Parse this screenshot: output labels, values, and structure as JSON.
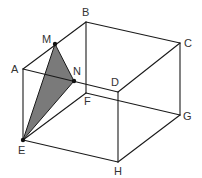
{
  "diagram": {
    "type": "cube-with-shaded-triangle",
    "vertices": {
      "A": {
        "x": 23,
        "y": 69,
        "label": "A",
        "lx": 11,
        "ly": 73
      },
      "B": {
        "x": 86,
        "y": 22,
        "label": "B",
        "lx": 82,
        "ly": 16
      },
      "C": {
        "x": 180,
        "y": 43,
        "label": "C",
        "lx": 184,
        "ly": 47
      },
      "D": {
        "x": 118,
        "y": 92,
        "label": "D",
        "lx": 111,
        "ly": 86
      },
      "E": {
        "x": 23,
        "y": 140,
        "label": "E",
        "lx": 18,
        "ly": 154
      },
      "F": {
        "x": 86,
        "y": 93,
        "label": "F",
        "lx": 84,
        "ly": 105
      },
      "G": {
        "x": 180,
        "y": 115,
        "label": "G",
        "lx": 183,
        "ly": 120
      },
      "H": {
        "x": 118,
        "y": 162,
        "label": "H",
        "lx": 114,
        "ly": 175
      },
      "M": {
        "x": 55,
        "y": 44,
        "label": "M",
        "lx": 42,
        "ly": 43
      },
      "N": {
        "x": 74,
        "y": 81,
        "label": "N",
        "lx": 73,
        "ly": 75
      }
    },
    "edges": [
      [
        "A",
        "B"
      ],
      [
        "B",
        "C"
      ],
      [
        "C",
        "D"
      ],
      [
        "D",
        "A"
      ],
      [
        "E",
        "F"
      ],
      [
        "F",
        "G"
      ],
      [
        "G",
        "H"
      ],
      [
        "H",
        "E"
      ],
      [
        "A",
        "E"
      ],
      [
        "B",
        "F"
      ],
      [
        "C",
        "G"
      ],
      [
        "D",
        "H"
      ]
    ],
    "shaded_triangle": [
      "M",
      "N",
      "E"
    ],
    "marked_points": [
      "M",
      "N",
      "E"
    ],
    "colors": {
      "line": "#1a1a1a",
      "fill": "#7a7a7a",
      "label": "#333333"
    }
  }
}
